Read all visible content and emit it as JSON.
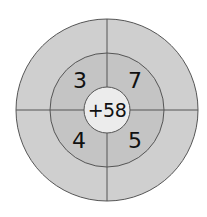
{
  "diagram": {
    "type": "number-target-wheel",
    "center": {
      "label": "+58"
    },
    "ring_values": [
      {
        "position": "top-left",
        "label": "3"
      },
      {
        "position": "top-right",
        "label": "7"
      },
      {
        "position": "bottom-left",
        "label": "4"
      },
      {
        "position": "bottom-right",
        "label": "5"
      }
    ],
    "colors": {
      "outer_ring": "#cfcfcf",
      "middle_ring": "#c4c4c4",
      "center": "#ececec",
      "lines": "#555555",
      "text": "#111111"
    }
  }
}
